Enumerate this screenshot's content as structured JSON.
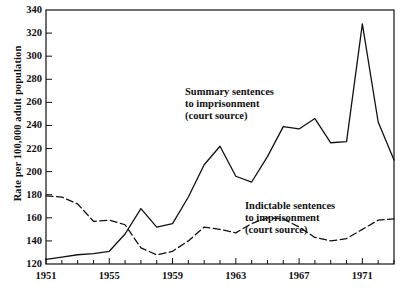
{
  "chart_data": {
    "type": "line",
    "title": "",
    "subtitle": "",
    "xlabel": "",
    "ylabel": "Rate per 100,000 adult population",
    "xlim": [
      1951,
      1973
    ],
    "ylim": [
      120,
      340
    ],
    "ytick_values": [
      120,
      140,
      160,
      180,
      200,
      220,
      240,
      260,
      280,
      300,
      320,
      340
    ],
    "ytick_labels": [
      "120",
      "140",
      "160",
      "180",
      "200",
      "220",
      "240",
      "260",
      "280",
      "300",
      "320",
      "340"
    ],
    "xtick_values": [
      1951,
      1955,
      1959,
      1963,
      1967,
      1971
    ],
    "xtick_labels": [
      "1951",
      "1955",
      "1959",
      "1963",
      "1967",
      "1971"
    ],
    "xtick_minor_step": 1,
    "grid": false,
    "legend_position": "inline-annotations",
    "x": [
      1951,
      1952,
      1953,
      1954,
      1955,
      1956,
      1957,
      1958,
      1959,
      1960,
      1961,
      1962,
      1963,
      1964,
      1965,
      1966,
      1967,
      1968,
      1969,
      1970,
      1971,
      1972,
      1973
    ],
    "series": [
      {
        "name": "Summary sentences to imprisonment (court source)",
        "style": "solid",
        "color": "#111111",
        "values": [
          124,
          126,
          128,
          129,
          131,
          146,
          168,
          152,
          155,
          178,
          206,
          222,
          196,
          191,
          213,
          239,
          237,
          246,
          225,
          226,
          328,
          243,
          210
        ]
      },
      {
        "name": "Indictable sentences to imprisonment (court source)",
        "style": "dashed",
        "color": "#111111",
        "values": [
          179,
          178,
          172,
          157,
          158,
          154,
          134,
          128,
          131,
          140,
          152,
          150,
          147,
          155,
          160,
          159,
          152,
          143,
          140,
          142,
          150,
          158,
          159
        ]
      }
    ],
    "annotations": [
      {
        "id": "summary",
        "lines": [
          "Summary sentences",
          "to imprisonment",
          "(court source)"
        ]
      },
      {
        "id": "indictable",
        "lines": [
          "Indictable sentences",
          "to imprisonment",
          "(court source)"
        ]
      }
    ]
  },
  "axis": {
    "ylabel": "Rate per 100,000 adult population"
  }
}
